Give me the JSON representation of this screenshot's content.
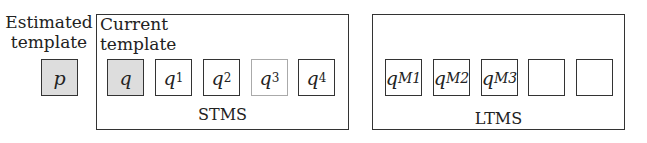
{
  "estimated": {
    "label_line1": "Estimated",
    "label_line2": "template",
    "symbol": "p"
  },
  "current": {
    "label_line1": "Current",
    "label_line2": "template",
    "symbol": "q"
  },
  "stms": {
    "label": "STMS",
    "cells": [
      {
        "base": "q",
        "sub": "1"
      },
      {
        "base": "q",
        "sub": "2"
      },
      {
        "base": "q",
        "sub": "3"
      },
      {
        "base": "q",
        "sub": "4"
      }
    ]
  },
  "ltms": {
    "label": "LTMS",
    "cells": [
      {
        "base": "q",
        "sub": "M1"
      },
      {
        "base": "q",
        "sub": "M2"
      },
      {
        "base": "q",
        "sub": "M3"
      },
      {
        "base": "",
        "sub": ""
      },
      {
        "base": "",
        "sub": ""
      }
    ]
  }
}
